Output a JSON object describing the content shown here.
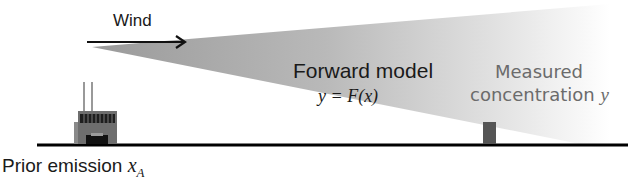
{
  "diagram": {
    "type": "inverse-modeling-schematic",
    "wind": {
      "label": "Wind",
      "direction": "left-to-right"
    },
    "forward_model": {
      "title": "Forward model",
      "equation": "y = F(x)"
    },
    "measurement": {
      "line1": "Measured",
      "line2_text": "concentration ",
      "line2_var": "y"
    },
    "source": {
      "text": "Prior emission ",
      "var": "x",
      "subscript": "A"
    },
    "colors": {
      "plume_start": "#9a9a9a",
      "plume_end": "#ffffff",
      "ground": "#000000",
      "factory_body": "#6e6e6e",
      "sensor": "#555555",
      "measured_text": "#6b6b6b"
    }
  }
}
